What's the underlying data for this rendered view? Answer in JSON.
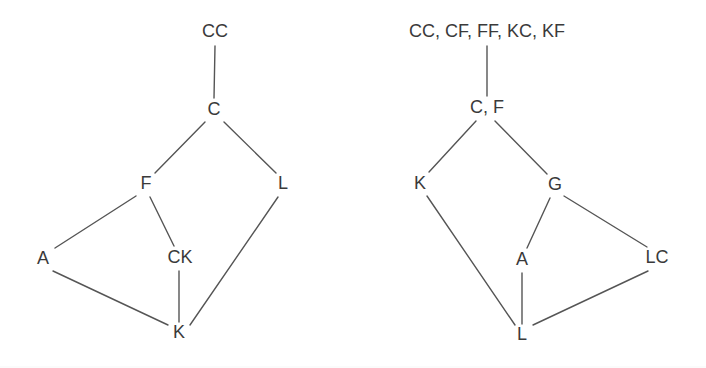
{
  "figure": {
    "background_color": "#ffffff",
    "line_color": "#555555",
    "text_color": "#3a3a3a"
  },
  "diagrams": [
    {
      "id": "left-diagram",
      "name": "left-lattice-diagram",
      "top_label": {
        "text": "CC",
        "x": 215,
        "y": 32
      },
      "nodes": [
        {
          "id": "C",
          "label": "C",
          "x": 214,
          "y": 110
        },
        {
          "id": "F",
          "label": "F",
          "x": 146,
          "y": 184
        },
        {
          "id": "L",
          "label": "L",
          "x": 283,
          "y": 184
        },
        {
          "id": "A",
          "label": "A",
          "x": 43,
          "y": 259
        },
        {
          "id": "CK",
          "label": "CK",
          "x": 180,
          "y": 258
        },
        {
          "id": "K",
          "label": "K",
          "x": 179,
          "y": 333
        }
      ],
      "edges": [
        {
          "from": "TOP",
          "to": "C",
          "x1": 215,
          "y1": 46,
          "x2": 214,
          "y2": 98
        },
        {
          "from": "C",
          "to": "F",
          "x1": 205,
          "y1": 122,
          "x2": 155,
          "y2": 173
        },
        {
          "from": "C",
          "to": "L",
          "x1": 224,
          "y1": 122,
          "x2": 276,
          "y2": 173
        },
        {
          "from": "F",
          "to": "A",
          "x1": 136,
          "y1": 196,
          "x2": 55,
          "y2": 248
        },
        {
          "from": "F",
          "to": "CK",
          "x1": 150,
          "y1": 197,
          "x2": 174,
          "y2": 246
        },
        {
          "from": "L",
          "to": "K",
          "x1": 278,
          "y1": 197,
          "x2": 190,
          "y2": 325
        },
        {
          "from": "A",
          "to": "K",
          "x1": 53,
          "y1": 271,
          "x2": 168,
          "y2": 325
        },
        {
          "from": "CK",
          "to": "K",
          "x1": 179,
          "y1": 271,
          "x2": 179,
          "y2": 322
        }
      ]
    },
    {
      "id": "right-diagram",
      "name": "right-lattice-diagram",
      "top_label": {
        "text": "CC, CF, FF, KC, KF",
        "x": 487,
        "y": 32
      },
      "nodes": [
        {
          "id": "CF",
          "label": "C, F",
          "x": 487,
          "y": 108
        },
        {
          "id": "K",
          "label": "K",
          "x": 420,
          "y": 184
        },
        {
          "id": "G",
          "label": "G",
          "x": 555,
          "y": 185
        },
        {
          "id": "A",
          "label": "A",
          "x": 522,
          "y": 260
        },
        {
          "id": "LC",
          "label": "LC",
          "x": 657,
          "y": 258
        },
        {
          "id": "L",
          "label": "L",
          "x": 522,
          "y": 335
        }
      ],
      "edges": [
        {
          "from": "TOP",
          "to": "CF",
          "x1": 487,
          "y1": 46,
          "x2": 487,
          "y2": 96
        },
        {
          "from": "CF",
          "to": "K",
          "x1": 476,
          "y1": 121,
          "x2": 429,
          "y2": 172
        },
        {
          "from": "CF",
          "to": "G",
          "x1": 495,
          "y1": 121,
          "x2": 547,
          "y2": 174
        },
        {
          "from": "K",
          "to": "L",
          "x1": 427,
          "y1": 196,
          "x2": 515,
          "y2": 325
        },
        {
          "from": "G",
          "to": "A",
          "x1": 550,
          "y1": 198,
          "x2": 527,
          "y2": 248
        },
        {
          "from": "G",
          "to": "LC",
          "x1": 564,
          "y1": 196,
          "x2": 647,
          "y2": 247
        },
        {
          "from": "A",
          "to": "L",
          "x1": 522,
          "y1": 273,
          "x2": 522,
          "y2": 324
        },
        {
          "from": "LC",
          "to": "L",
          "x1": 648,
          "y1": 271,
          "x2": 533,
          "y2": 325
        }
      ]
    }
  ]
}
